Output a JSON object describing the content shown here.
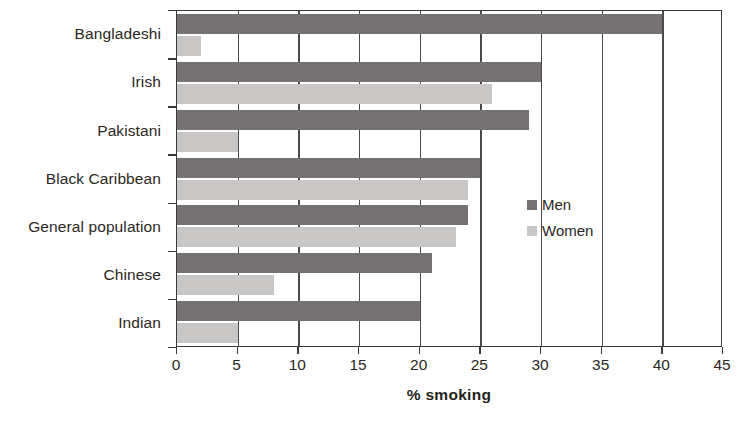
{
  "chart_data": {
    "type": "bar",
    "orientation": "horizontal",
    "title": "",
    "xlabel": "% smoking",
    "ylabel": "",
    "xlim": [
      0,
      45
    ],
    "xticks": [
      0,
      5,
      10,
      15,
      20,
      25,
      30,
      35,
      40,
      45
    ],
    "grid": true,
    "grid_axis": "x",
    "legend_position": "right-middle",
    "categories": [
      "Bangladeshi",
      "Irish",
      "Pakistani",
      "Black Caribbean",
      "General population",
      "Chinese",
      "Indian"
    ],
    "series": [
      {
        "name": "Men",
        "color": "#767172",
        "values": [
          40,
          30,
          29,
          25,
          24,
          21,
          20
        ]
      },
      {
        "name": "Women",
        "color": "#c8c7c5",
        "values": [
          2,
          26,
          5,
          24,
          23,
          8,
          5
        ]
      }
    ]
  },
  "axis": {
    "x_title": "% smoking",
    "tick_labels": [
      "0",
      "5",
      "10",
      "15",
      "20",
      "25",
      "30",
      "35",
      "40",
      "45"
    ]
  },
  "legend": {
    "items": [
      {
        "label": "Men"
      },
      {
        "label": "Women"
      }
    ]
  },
  "colors": {
    "men": "#767172",
    "women": "#c8c7c5",
    "axis": "#3a3a3a",
    "text": "#2b2724",
    "background": "#ffffff"
  }
}
